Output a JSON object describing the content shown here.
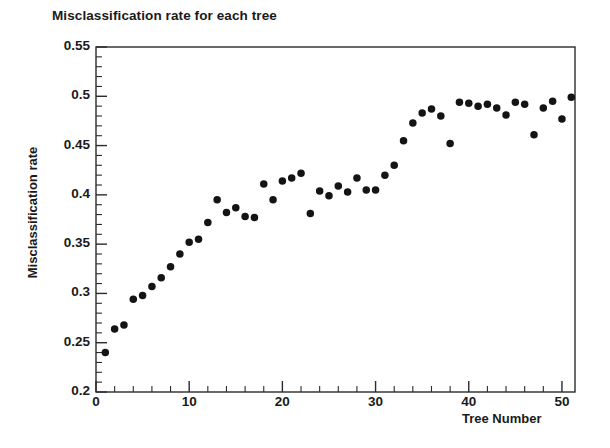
{
  "chart_data": {
    "type": "scatter",
    "title": "Misclassification rate for each tree",
    "xlabel": "Tree Number",
    "ylabel": "Misclassification rate",
    "xlim": [
      0,
      51.4
    ],
    "ylim": [
      0.2,
      0.55
    ],
    "grid": false,
    "legend": null,
    "marker": {
      "shape": "circle",
      "color": "#141414",
      "size": 7.5
    },
    "x_ticks": [
      0,
      10,
      20,
      30,
      40,
      50
    ],
    "x_tick_labels": [
      "0",
      "10",
      "20",
      "30",
      "40",
      "50"
    ],
    "x_minor_tick_step": 2,
    "y_ticks": [
      0.2,
      0.25,
      0.3,
      0.35,
      0.4,
      0.45,
      0.5,
      0.55
    ],
    "y_tick_labels": [
      "0.2",
      "0.25",
      "0.3",
      "0.35",
      "0.4",
      "0.45",
      "0.5",
      "0.55"
    ],
    "y_minor_tick_step": 0.01,
    "x": [
      1,
      2,
      3,
      4,
      5,
      6,
      7,
      8,
      9,
      10,
      11,
      12,
      13,
      14,
      15,
      16,
      17,
      18,
      19,
      20,
      21,
      22,
      23,
      24,
      25,
      26,
      27,
      28,
      29,
      30,
      31,
      32,
      33,
      34,
      35,
      36,
      37,
      38,
      39,
      40,
      41,
      42,
      43,
      44,
      45,
      46,
      47,
      48,
      49,
      50,
      51
    ],
    "values": [
      0.24,
      0.264,
      0.268,
      0.294,
      0.298,
      0.307,
      0.316,
      0.327,
      0.34,
      0.352,
      0.355,
      0.372,
      0.395,
      0.382,
      0.387,
      0.378,
      0.377,
      0.411,
      0.395,
      0.414,
      0.417,
      0.422,
      0.381,
      0.404,
      0.399,
      0.409,
      0.403,
      0.417,
      0.405,
      0.405,
      0.42,
      0.43,
      0.455,
      0.473,
      0.483,
      0.487,
      0.48,
      0.452,
      0.494,
      0.493,
      0.49,
      0.492,
      0.488,
      0.481,
      0.494,
      0.492,
      0.461,
      0.488,
      0.495,
      0.477,
      0.499
    ],
    "series": [
      {
        "name": "Misclassification rate",
        "points": [
          {
            "tree": 1,
            "rate": 0.24
          },
          {
            "tree": 2,
            "rate": 0.264
          },
          {
            "tree": 3,
            "rate": 0.268
          },
          {
            "tree": 4,
            "rate": 0.294
          },
          {
            "tree": 5,
            "rate": 0.298
          },
          {
            "tree": 6,
            "rate": 0.307
          },
          {
            "tree": 7,
            "rate": 0.316
          },
          {
            "tree": 8,
            "rate": 0.327
          },
          {
            "tree": 9,
            "rate": 0.34
          },
          {
            "tree": 10,
            "rate": 0.352
          },
          {
            "tree": 11,
            "rate": 0.355
          },
          {
            "tree": 12,
            "rate": 0.372
          },
          {
            "tree": 13,
            "rate": 0.395
          },
          {
            "tree": 14,
            "rate": 0.382
          },
          {
            "tree": 15,
            "rate": 0.387
          },
          {
            "tree": 16,
            "rate": 0.378
          },
          {
            "tree": 17,
            "rate": 0.377
          },
          {
            "tree": 18,
            "rate": 0.411
          },
          {
            "tree": 19,
            "rate": 0.395
          },
          {
            "tree": 20,
            "rate": 0.414
          },
          {
            "tree": 21,
            "rate": 0.417
          },
          {
            "tree": 22,
            "rate": 0.422
          },
          {
            "tree": 23,
            "rate": 0.381
          },
          {
            "tree": 24,
            "rate": 0.404
          },
          {
            "tree": 25,
            "rate": 0.399
          },
          {
            "tree": 26,
            "rate": 0.409
          },
          {
            "tree": 27,
            "rate": 0.403
          },
          {
            "tree": 28,
            "rate": 0.417
          },
          {
            "tree": 29,
            "rate": 0.405
          },
          {
            "tree": 30,
            "rate": 0.405
          },
          {
            "tree": 31,
            "rate": 0.42
          },
          {
            "tree": 32,
            "rate": 0.43
          },
          {
            "tree": 33,
            "rate": 0.455
          },
          {
            "tree": 34,
            "rate": 0.473
          },
          {
            "tree": 35,
            "rate": 0.483
          },
          {
            "tree": 36,
            "rate": 0.487
          },
          {
            "tree": 37,
            "rate": 0.48
          },
          {
            "tree": 38,
            "rate": 0.452
          },
          {
            "tree": 39,
            "rate": 0.494
          },
          {
            "tree": 40,
            "rate": 0.493
          },
          {
            "tree": 41,
            "rate": 0.49
          },
          {
            "tree": 42,
            "rate": 0.492
          },
          {
            "tree": 43,
            "rate": 0.488
          },
          {
            "tree": 44,
            "rate": 0.481
          },
          {
            "tree": 45,
            "rate": 0.494
          },
          {
            "tree": 46,
            "rate": 0.492
          },
          {
            "tree": 47,
            "rate": 0.461
          },
          {
            "tree": 48,
            "rate": 0.488
          },
          {
            "tree": 49,
            "rate": 0.495
          },
          {
            "tree": 50,
            "rate": 0.477
          },
          {
            "tree": 51,
            "rate": 0.499
          }
        ]
      }
    ],
    "colors": {
      "marker": "#141414",
      "axis": "#2b2b2b",
      "background": "#ffffff",
      "text": "#1a1a1a"
    }
  }
}
